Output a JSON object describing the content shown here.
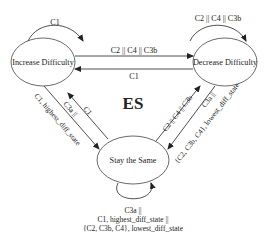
{
  "diagram": {
    "center_label": "ES",
    "states": [
      {
        "id": "increase",
        "label": "Increase Difficulty"
      },
      {
        "id": "decrease",
        "label": "Decrease Difficulty"
      },
      {
        "id": "same",
        "label": "Stay the Same"
      }
    ],
    "transitions": {
      "increase_self": "C1",
      "decrease_self": "C2 || C4 || C3b",
      "increase_to_decrease": "C2 || C4 || C3b",
      "decrease_to_increase": "C1",
      "same_to_increase": "C1",
      "increase_to_same_line1": "C3a ||",
      "increase_to_same_line2": "C1, highest_diff_state",
      "same_to_decrease": "C2 || C4 || C3b",
      "decrease_to_same_line1": "C3a ||",
      "decrease_to_same_line2": "{C2, C3b, C4}, lowest_diff_state",
      "same_self_line1": "C3a ||",
      "same_self_line2": "C1, highest_diff_state ||",
      "same_self_line3": "{C2, C3b, C4}, lowest_diff_state"
    }
  }
}
